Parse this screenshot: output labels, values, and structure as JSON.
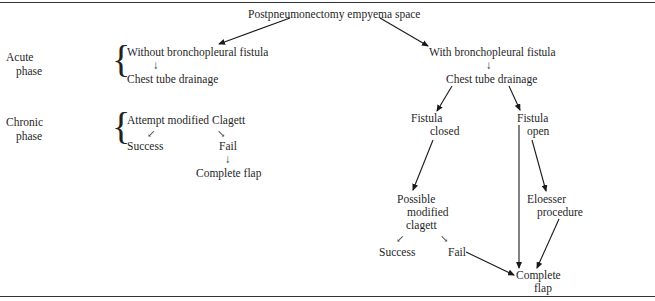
{
  "diagram": {
    "root": "Postpneumonectomy empyema space",
    "phases": {
      "acute": "Acute\nphase",
      "acute_line1": "Acute",
      "acute_line2": "phase",
      "chronic_line1": "Chronic",
      "chronic_line2": "phase"
    },
    "left_branch": {
      "without_fistula": "Without bronchopleural fistula",
      "down_arrow": "↓",
      "chest_tube": "Chest tube drainage",
      "attempt_clagett": "Attempt modified Clagett",
      "arrow_left": "↙",
      "arrow_right": "↘",
      "success": "Success",
      "fail": "Fail",
      "fail_down_arrow": "↓",
      "complete_flap": "Complete flap"
    },
    "right_branch": {
      "with_fistula": "With bronchopleural fistula",
      "down_arrow": "↓",
      "chest_tube": "Chest tube drainage",
      "fistula_closed_line1": "Fistula",
      "fistula_closed_line2": "closed",
      "fistula_open_line1": "Fistula",
      "fistula_open_line2": "open",
      "possible_line1": "Possible",
      "possible_line2": "modified",
      "possible_line3": "clagett",
      "arrow_left": "↙",
      "arrow_right": "↘",
      "success": "Success",
      "fail": "Fail",
      "eloesser_line1": "Eloesser",
      "eloesser_line2": "procedure",
      "complete_line1": "Complete",
      "complete_line2": "flap"
    },
    "edges": [
      {
        "from": "root",
        "to": "without_fistula"
      },
      {
        "from": "root",
        "to": "with_fistula"
      },
      {
        "from": "without_fistula",
        "to": "left_chest_tube"
      },
      {
        "from": "attempt_clagett",
        "to": "left_success"
      },
      {
        "from": "attempt_clagett",
        "to": "left_fail"
      },
      {
        "from": "left_fail",
        "to": "left_complete_flap"
      },
      {
        "from": "with_fistula",
        "to": "right_chest_tube"
      },
      {
        "from": "right_chest_tube",
        "to": "fistula_closed"
      },
      {
        "from": "right_chest_tube",
        "to": "fistula_open"
      },
      {
        "from": "fistula_closed",
        "to": "possible_clagett"
      },
      {
        "from": "possible_clagett",
        "to": "right_success"
      },
      {
        "from": "possible_clagett",
        "to": "right_fail"
      },
      {
        "from": "right_fail",
        "to": "right_complete_flap"
      },
      {
        "from": "fistula_open",
        "to": "right_complete_flap"
      },
      {
        "from": "fistula_open",
        "to": "eloesser"
      },
      {
        "from": "eloesser",
        "to": "right_complete_flap"
      }
    ]
  }
}
